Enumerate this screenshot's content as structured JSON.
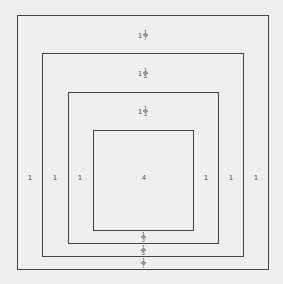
{
  "squares": [
    {
      "name": "square-outer",
      "left": 17,
      "top": 15,
      "right": 268,
      "bottom": 269
    },
    {
      "name": "square-2",
      "left": 42,
      "top": 53,
      "right": 243,
      "bottom": 256
    },
    {
      "name": "square-3",
      "left": 68,
      "top": 92,
      "right": 218,
      "bottom": 243
    },
    {
      "name": "square-inner",
      "left": 93,
      "top": 130,
      "right": 193,
      "bottom": 230
    }
  ],
  "labels": {
    "top1": {
      "whole": "1",
      "num": "1",
      "den": "7"
    },
    "top2": {
      "whole": "1",
      "num": "1",
      "den": "5"
    },
    "top3": {
      "whole": "1",
      "num": "1",
      "den": "3"
    },
    "center": "4",
    "left1": "1",
    "left2": "1",
    "left3": "1",
    "right1": "1",
    "right2": "1",
    "right3": "1",
    "bottom1": {
      "num": "1",
      "den": "3"
    },
    "bottom2": {
      "num": "1",
      "den": "5"
    },
    "bottom3": {
      "num": "1",
      "den": "7"
    }
  }
}
